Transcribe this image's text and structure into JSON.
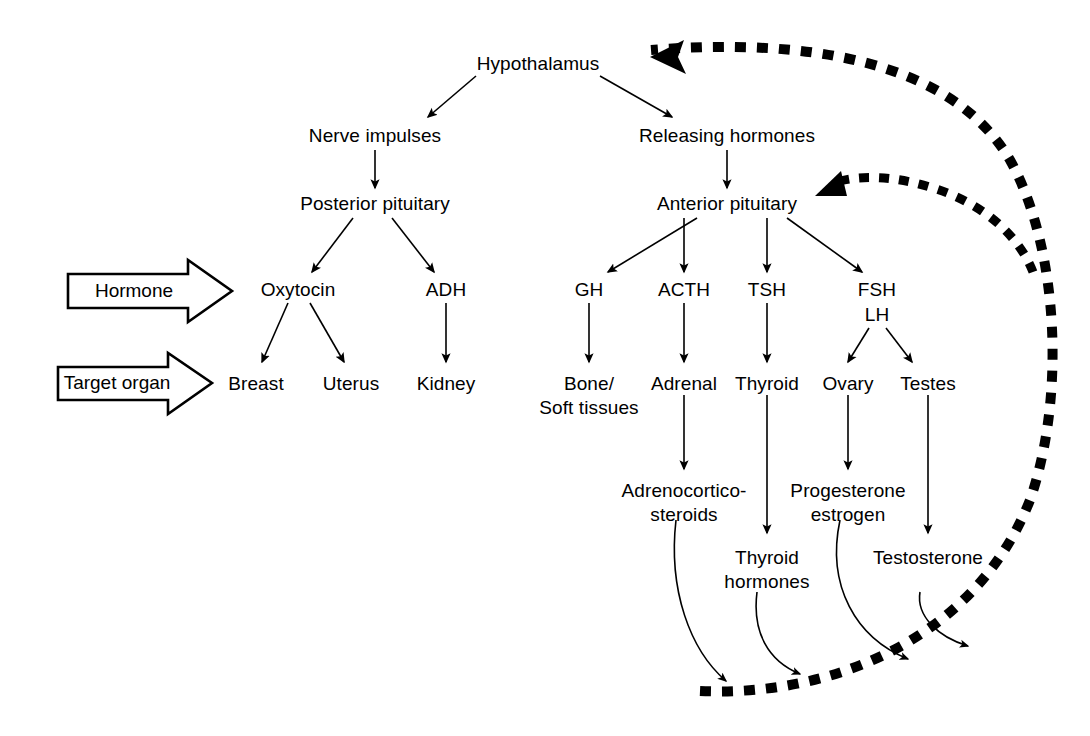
{
  "diagram": {
    "colors": {
      "ink": "#000000",
      "background": "#ffffff",
      "feedback": "#000000"
    },
    "callouts": [
      {
        "id": "hormone",
        "label": "Hormone"
      },
      {
        "id": "target-organ",
        "label": "Target organ"
      }
    ],
    "nodes": {
      "hypothalamus": "Hypothalamus",
      "nerve_impulses": "Nerve impulses",
      "releasing_hormones": "Releasing hormones",
      "posterior_pituitary": "Posterior pituitary",
      "anterior_pituitary": "Anterior pituitary",
      "oxytocin": "Oxytocin",
      "adh": "ADH",
      "gh": "GH",
      "acth": "ACTH",
      "tsh": "TSH",
      "fsh": "FSH",
      "lh": "LH",
      "breast": "Breast",
      "uterus": "Uterus",
      "kidney": "Kidney",
      "bone_soft_tissues_line1": "Bone/",
      "bone_soft_tissues_line2": "Soft tissues",
      "adrenal": "Adrenal",
      "thyroid": "Thyroid",
      "ovary": "Ovary",
      "testes": "Testes",
      "adrenocorticosteroids_line1": "Adrenocortico-",
      "adrenocorticosteroids_line2": "steroids",
      "thyroid_hormones_line1": "Thyroid",
      "thyroid_hormones_line2": "hormones",
      "progesterone_estrogen_line1": "Progesterone",
      "progesterone_estrogen_line2": "estrogen",
      "testosterone": "Testosterone"
    },
    "edges": [
      {
        "from": "hypothalamus",
        "to": "nerve_impulses",
        "style": "solid-arrow"
      },
      {
        "from": "hypothalamus",
        "to": "releasing_hormones",
        "style": "solid-arrow"
      },
      {
        "from": "nerve_impulses",
        "to": "posterior_pituitary",
        "style": "solid-arrow"
      },
      {
        "from": "releasing_hormones",
        "to": "anterior_pituitary",
        "style": "solid-arrow"
      },
      {
        "from": "posterior_pituitary",
        "to": "oxytocin",
        "style": "solid-arrow"
      },
      {
        "from": "posterior_pituitary",
        "to": "adh",
        "style": "solid-arrow"
      },
      {
        "from": "anterior_pituitary",
        "to": "gh",
        "style": "solid-arrow"
      },
      {
        "from": "anterior_pituitary",
        "to": "acth",
        "style": "solid-arrow"
      },
      {
        "from": "anterior_pituitary",
        "to": "tsh",
        "style": "solid-arrow"
      },
      {
        "from": "anterior_pituitary",
        "to": "fsh",
        "style": "solid-arrow"
      },
      {
        "from": "oxytocin",
        "to": "breast",
        "style": "solid-arrow"
      },
      {
        "from": "oxytocin",
        "to": "uterus",
        "style": "solid-arrow"
      },
      {
        "from": "adh",
        "to": "kidney",
        "style": "solid-arrow"
      },
      {
        "from": "gh",
        "to": "bone_soft_tissues",
        "style": "solid-arrow"
      },
      {
        "from": "acth",
        "to": "adrenal",
        "style": "solid-arrow"
      },
      {
        "from": "tsh",
        "to": "thyroid",
        "style": "solid-arrow"
      },
      {
        "from": "lh",
        "to": "ovary",
        "style": "solid-arrow"
      },
      {
        "from": "lh",
        "to": "testes",
        "style": "solid-arrow"
      },
      {
        "from": "adrenal",
        "to": "adrenocorticosteroids",
        "style": "solid-arrow"
      },
      {
        "from": "thyroid",
        "to": "thyroid_hormones",
        "style": "solid-arrow"
      },
      {
        "from": "ovary",
        "to": "progesterone_estrogen",
        "style": "solid-arrow"
      },
      {
        "from": "testes",
        "to": "testosterone",
        "style": "solid-arrow"
      },
      {
        "from": "adrenocorticosteroids",
        "to": "feedback_path",
        "style": "curved-arrow"
      },
      {
        "from": "thyroid_hormones",
        "to": "feedback_path",
        "style": "curved-arrow"
      },
      {
        "from": "progesterone_estrogen",
        "to": "feedback_path",
        "style": "curved-arrow"
      },
      {
        "from": "testosterone",
        "to": "feedback_path",
        "style": "curved-arrow"
      },
      {
        "from": "feedback_path",
        "to": "hypothalamus",
        "style": "dashed-thick-arrow"
      },
      {
        "from": "feedback_path",
        "to": "anterior_pituitary",
        "style": "dashed-thick-arrow"
      }
    ]
  }
}
